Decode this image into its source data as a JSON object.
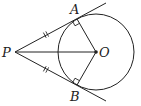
{
  "diagram": {
    "points": {
      "P": {
        "label": "P",
        "x": 15,
        "y": 52
      },
      "O": {
        "label": "O",
        "x": 96,
        "y": 52
      },
      "A": {
        "label": "A",
        "x": 77,
        "y": 19
      },
      "B": {
        "label": "B",
        "x": 77,
        "y": 85
      }
    },
    "circle": {
      "center": "O",
      "radius": 38
    },
    "segments": [
      "PA",
      "PB",
      "PO",
      "OA",
      "OB"
    ],
    "right_angles": [
      "PAO",
      "PBO"
    ],
    "equal_marks": [
      "PA",
      "PB"
    ],
    "colors": {
      "stroke": "#222222",
      "background": "#ffffff"
    }
  }
}
